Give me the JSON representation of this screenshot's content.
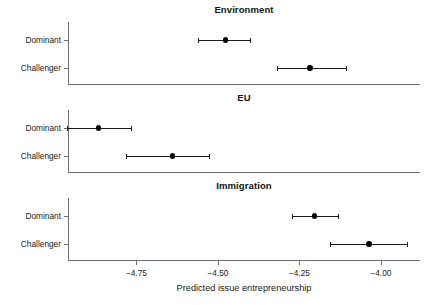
{
  "figure": {
    "x_axis_title": "Predicted issue entrepreneurship",
    "x_tick_labels": [
      "−4.75",
      "−4.50",
      "−4.25",
      "−4.00"
    ],
    "y_categories": [
      "Dominant",
      "Challenger"
    ],
    "panel_titles": [
      "Environment",
      "EU",
      "Immigration"
    ],
    "colors": {
      "point": "#000000",
      "interval": "#1c1c1c",
      "axis": "#6e6e6e",
      "background": "#ffffff",
      "text": "#1a1a1a"
    }
  },
  "chart_data": {
    "type": "scatter",
    "title": "",
    "xlabel": "Predicted issue entrepreneurship",
    "ylabel": "",
    "xlim": [
      -4.96,
      -3.88
    ],
    "xticks": [
      -4.75,
      -4.5,
      -4.25,
      -4.0
    ],
    "xticklabels": [
      "−4.75",
      "−4.50",
      "−4.25",
      "−4.00"
    ],
    "grid": false,
    "legend": "none",
    "orientation": "horizontal",
    "error_bars": "confidence interval",
    "panels": [
      {
        "title": "Environment",
        "categories": [
          "Dominant",
          "Challenger"
        ],
        "points": [
          {
            "label": "Dominant",
            "estimate": -4.477,
            "ci_low": -4.56,
            "ci_high": -4.403
          },
          {
            "label": "Challenger",
            "estimate": -4.217,
            "ci_low": -4.32,
            "ci_high": -4.107
          }
        ]
      },
      {
        "title": "EU",
        "categories": [
          "Dominant",
          "Challenger"
        ],
        "points": [
          {
            "label": "Dominant",
            "estimate": -4.867,
            "ci_low": -4.963,
            "ci_high": -4.767
          },
          {
            "label": "Challenger",
            "estimate": -4.64,
            "ci_low": -4.783,
            "ci_high": -4.527
          }
        ]
      },
      {
        "title": "Immigration",
        "categories": [
          "Dominant",
          "Challenger"
        ],
        "points": [
          {
            "label": "Dominant",
            "estimate": -4.203,
            "ci_low": -4.273,
            "ci_high": -4.133
          },
          {
            "label": "Challenger",
            "estimate": -4.037,
            "ci_low": -4.157,
            "ci_high": -3.92
          }
        ]
      }
    ]
  }
}
